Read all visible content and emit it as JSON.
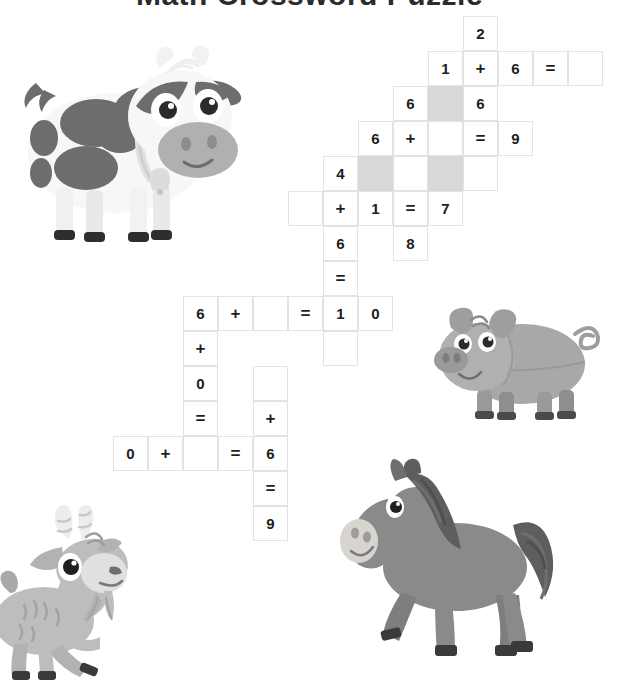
{
  "page": {
    "title": "Math Crossword Puzzle",
    "background": "#ffffff",
    "width": 619,
    "height": 682
  },
  "palette": {
    "cell_border": "#e3e3e3",
    "cell_bg": "#ffffff",
    "cell_shaded": "#d9d9d9",
    "text": "#1d1d1d",
    "cow_dark": "#6d6d6d",
    "cow_light": "#f4f4f4",
    "pig_body": "#a8a8a8",
    "pig_dark": "#8e8e8e",
    "horse_body": "#8a8a8a",
    "horse_mane": "#5e5e5e",
    "goat_body": "#bdbdbd",
    "goat_dark": "#8f8f8f",
    "hoof": "#3a3a3a"
  },
  "grid": {
    "cell_size": 35,
    "origin_x": 113,
    "origin_y": 16,
    "cells": [
      {
        "col": 10,
        "row": 0,
        "text": "2",
        "shaded": false,
        "kind": "digit"
      },
      {
        "col": 9,
        "row": 1,
        "text": "1",
        "shaded": false,
        "kind": "digit"
      },
      {
        "col": 10,
        "row": 1,
        "text": "+",
        "shaded": false,
        "kind": "operator"
      },
      {
        "col": 11,
        "row": 1,
        "text": "6",
        "shaded": false,
        "kind": "digit"
      },
      {
        "col": 12,
        "row": 1,
        "text": "=",
        "shaded": false,
        "kind": "operator"
      },
      {
        "col": 13,
        "row": 1,
        "text": "",
        "shaded": false,
        "kind": "blank"
      },
      {
        "col": 8,
        "row": 2,
        "text": "6",
        "shaded": false,
        "kind": "digit"
      },
      {
        "col": 9,
        "row": 2,
        "text": "",
        "shaded": true,
        "kind": "shaded"
      },
      {
        "col": 10,
        "row": 2,
        "text": "6",
        "shaded": false,
        "kind": "digit"
      },
      {
        "col": 7,
        "row": 3,
        "text": "6",
        "shaded": false,
        "kind": "digit"
      },
      {
        "col": 8,
        "row": 3,
        "text": "+",
        "shaded": false,
        "kind": "operator"
      },
      {
        "col": 9,
        "row": 3,
        "text": "",
        "shaded": false,
        "kind": "blank"
      },
      {
        "col": 10,
        "row": 3,
        "text": "=",
        "shaded": false,
        "kind": "operator"
      },
      {
        "col": 11,
        "row": 3,
        "text": "9",
        "shaded": false,
        "kind": "digit"
      },
      {
        "col": 6,
        "row": 4,
        "text": "4",
        "shaded": false,
        "kind": "digit"
      },
      {
        "col": 7,
        "row": 4,
        "text": "",
        "shaded": true,
        "kind": "shaded"
      },
      {
        "col": 8,
        "row": 4,
        "text": "",
        "shaded": false,
        "kind": "blank"
      },
      {
        "col": 9,
        "row": 4,
        "text": "",
        "shaded": true,
        "kind": "shaded"
      },
      {
        "col": 10,
        "row": 4,
        "text": "",
        "shaded": false,
        "kind": "blank"
      },
      {
        "col": 5,
        "row": 5,
        "text": "",
        "shaded": false,
        "kind": "blank"
      },
      {
        "col": 6,
        "row": 5,
        "text": "+",
        "shaded": false,
        "kind": "operator"
      },
      {
        "col": 7,
        "row": 5,
        "text": "1",
        "shaded": false,
        "kind": "digit"
      },
      {
        "col": 8,
        "row": 5,
        "text": "=",
        "shaded": false,
        "kind": "operator"
      },
      {
        "col": 9,
        "row": 5,
        "text": "7",
        "shaded": false,
        "kind": "digit"
      },
      {
        "col": 6,
        "row": 6,
        "text": "6",
        "shaded": false,
        "kind": "digit"
      },
      {
        "col": 8,
        "row": 6,
        "text": "8",
        "shaded": false,
        "kind": "digit"
      },
      {
        "col": 6,
        "row": 7,
        "text": "=",
        "shaded": false,
        "kind": "operator"
      },
      {
        "col": 2,
        "row": 8,
        "text": "6",
        "shaded": false,
        "kind": "digit"
      },
      {
        "col": 3,
        "row": 8,
        "text": "+",
        "shaded": false,
        "kind": "operator"
      },
      {
        "col": 4,
        "row": 8,
        "text": "",
        "shaded": false,
        "kind": "blank"
      },
      {
        "col": 5,
        "row": 8,
        "text": "=",
        "shaded": false,
        "kind": "operator"
      },
      {
        "col": 6,
        "row": 8,
        "text": "1",
        "shaded": false,
        "kind": "digit"
      },
      {
        "col": 7,
        "row": 8,
        "text": "0",
        "shaded": false,
        "kind": "digit"
      },
      {
        "col": 2,
        "row": 9,
        "text": "+",
        "shaded": false,
        "kind": "operator"
      },
      {
        "col": 6,
        "row": 9,
        "text": "",
        "shaded": false,
        "kind": "blank"
      },
      {
        "col": 2,
        "row": 10,
        "text": "0",
        "shaded": false,
        "kind": "digit"
      },
      {
        "col": 4,
        "row": 10,
        "text": "",
        "shaded": false,
        "kind": "blank"
      },
      {
        "col": 2,
        "row": 11,
        "text": "=",
        "shaded": false,
        "kind": "operator"
      },
      {
        "col": 4,
        "row": 11,
        "text": "+",
        "shaded": false,
        "kind": "operator"
      },
      {
        "col": 0,
        "row": 12,
        "text": "0",
        "shaded": false,
        "kind": "digit"
      },
      {
        "col": 1,
        "row": 12,
        "text": "+",
        "shaded": false,
        "kind": "operator"
      },
      {
        "col": 2,
        "row": 12,
        "text": "",
        "shaded": false,
        "kind": "blank"
      },
      {
        "col": 3,
        "row": 12,
        "text": "=",
        "shaded": false,
        "kind": "operator"
      },
      {
        "col": 4,
        "row": 12,
        "text": "6",
        "shaded": false,
        "kind": "digit"
      },
      {
        "col": 4,
        "row": 13,
        "text": "=",
        "shaded": false,
        "kind": "operator"
      },
      {
        "col": 4,
        "row": 14,
        "text": "9",
        "shaded": false,
        "kind": "digit"
      }
    ]
  },
  "illustrations": [
    {
      "name": "cow",
      "label": "Cow",
      "x": 8,
      "y": 38,
      "w": 245,
      "h": 215
    },
    {
      "name": "pig",
      "label": "Pig",
      "x": 425,
      "y": 302,
      "w": 190,
      "h": 130
    },
    {
      "name": "horse",
      "label": "Horse",
      "x": 335,
      "y": 455,
      "w": 225,
      "h": 205
    },
    {
      "name": "goat",
      "label": "Goat",
      "x": 0,
      "y": 505,
      "w": 160,
      "h": 177
    }
  ]
}
